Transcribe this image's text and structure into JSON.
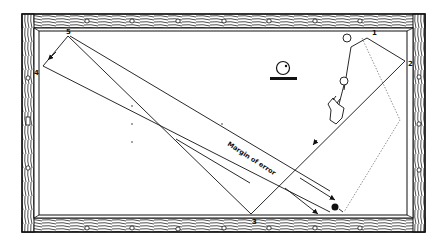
{
  "figure": {
    "annotation": "Margin of error",
    "rail_labels": [
      {
        "id": "1",
        "text": "1",
        "x": 374,
        "y": 34
      },
      {
        "id": "2",
        "text": "2",
        "x": 410,
        "y": 63
      },
      {
        "id": "3",
        "text": "3",
        "x": 254,
        "y": 222
      },
      {
        "id": "4",
        "text": "4",
        "x": 36,
        "y": 73
      },
      {
        "id": "5",
        "text": "5",
        "x": 68,
        "y": 33
      }
    ],
    "colors": {
      "ink": "#111111",
      "background": "#ffffff",
      "dotted": "#777777"
    }
  }
}
